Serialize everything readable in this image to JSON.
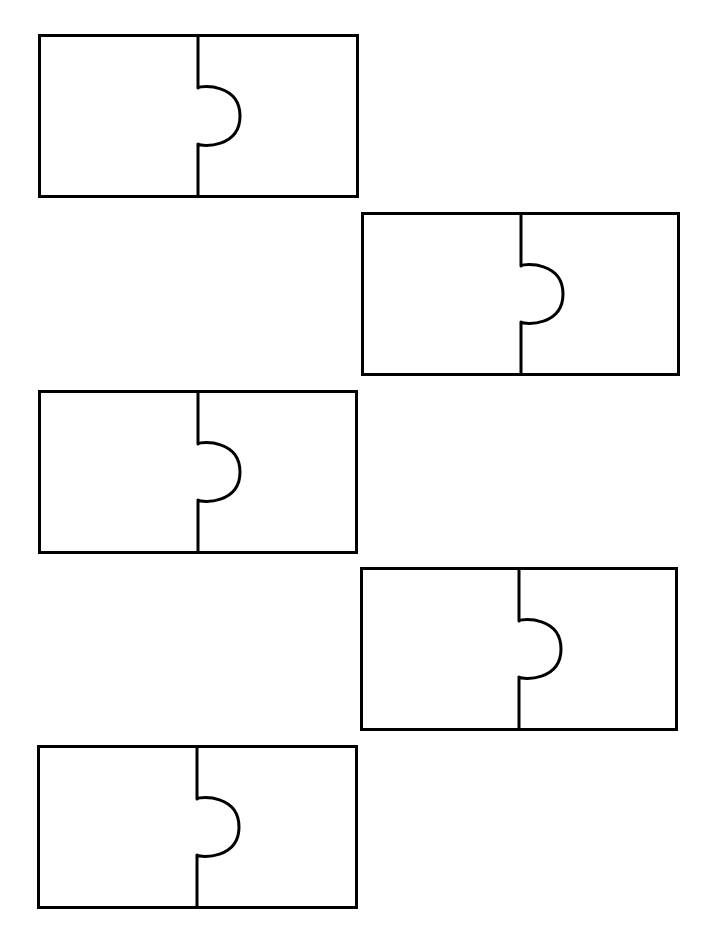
{
  "worksheet": {
    "background": "#ffffff",
    "stroke_color": "#000000",
    "stroke_width": 3,
    "pieces": [
      {
        "id": "pair-1",
        "x": 38,
        "y": 34,
        "width": 321,
        "height": 164,
        "split_x": 160,
        "knob_radius": 28
      },
      {
        "id": "pair-2",
        "x": 361,
        "y": 212,
        "width": 319,
        "height": 164,
        "split_x": 160,
        "knob_radius": 28
      },
      {
        "id": "pair-3",
        "x": 38,
        "y": 390,
        "width": 320,
        "height": 164,
        "split_x": 160,
        "knob_radius": 28
      },
      {
        "id": "pair-4",
        "x": 360,
        "y": 567,
        "width": 318,
        "height": 164,
        "split_x": 159,
        "knob_radius": 28
      },
      {
        "id": "pair-5",
        "x": 37,
        "y": 745,
        "width": 321,
        "height": 164,
        "split_x": 160,
        "knob_radius": 28
      }
    ]
  }
}
